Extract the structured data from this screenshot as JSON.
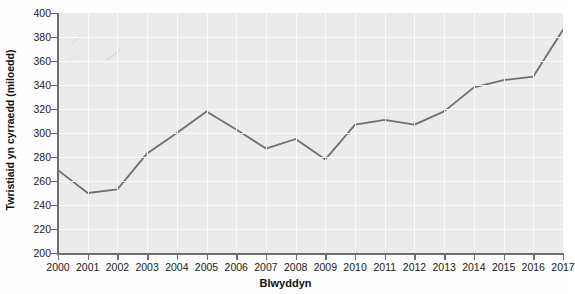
{
  "chart_data": {
    "type": "line",
    "title": "",
    "xlabel": "Blwyddyn",
    "ylabel": "Twristiaid yn cyrraedd (miloedd)",
    "categories": [
      2000,
      2001,
      2002,
      2003,
      2004,
      2005,
      2006,
      2007,
      2008,
      2009,
      2010,
      2011,
      2012,
      2013,
      2014,
      2015,
      2016,
      2017
    ],
    "x_tick_labels": [
      "2000",
      "2001",
      "2002",
      "2003",
      "2004",
      "2005",
      "2006",
      "2007",
      "2008",
      "2009",
      "2010",
      "2011",
      "2012",
      "2013",
      "2014",
      "2015",
      "2016",
      "2017"
    ],
    "values": [
      269,
      250,
      253,
      283,
      300,
      318,
      303,
      287,
      295,
      278,
      307,
      311,
      307,
      318,
      338,
      344,
      347,
      386
    ],
    "y_tick_labels": [
      "200",
      "220",
      "240",
      "260",
      "280",
      "300",
      "320",
      "340",
      "360",
      "380",
      "400"
    ],
    "y_ticks": [
      200,
      220,
      240,
      260,
      280,
      300,
      320,
      340,
      360,
      380,
      400
    ],
    "ylim": [
      200,
      400
    ],
    "xlim": [
      2000,
      2017
    ],
    "grid": true,
    "legend": false,
    "series": [
      {
        "name": "Twristiaid yn cyrraedd (miloedd)",
        "values": [
          269,
          250,
          253,
          283,
          300,
          318,
          303,
          287,
          295,
          278,
          307,
          311,
          307,
          318,
          338,
          344,
          347,
          386
        ]
      }
    ],
    "colors": {
      "line": "#6f6f6f",
      "plot_background": "#ebebeb",
      "gridline": "#fbfbfb",
      "axis": "#6e6e6e",
      "text": "#1a1a1a"
    },
    "annotations": [
      {
        "name": "pencil-mark-1",
        "note": "faint diagonal pencil stroke"
      },
      {
        "name": "pencil-mark-2",
        "note": "faint diagonal pencil stroke"
      },
      {
        "name": "pencil-mark-3",
        "note": "faint diagonal pencil stroke"
      }
    ]
  }
}
